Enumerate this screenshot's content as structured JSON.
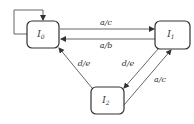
{
  "diagram": {
    "type": "state-transition",
    "nodes": [
      {
        "id": "I0",
        "label": "I",
        "sub": "0"
      },
      {
        "id": "I1",
        "label": "I",
        "sub": "1"
      },
      {
        "id": "I2",
        "label": "I",
        "sub": "2"
      }
    ],
    "edges": [
      {
        "from": "I0",
        "to": "I0",
        "label": ""
      },
      {
        "from": "I0",
        "to": "I1",
        "label": "a/c"
      },
      {
        "from": "I1",
        "to": "I0",
        "label": "a/b"
      },
      {
        "from": "I1",
        "to": "I2",
        "label": "d/e"
      },
      {
        "from": "I2",
        "to": "I0",
        "label": "d/e"
      },
      {
        "from": "I2",
        "to": "I1",
        "label": "a/c"
      }
    ]
  }
}
